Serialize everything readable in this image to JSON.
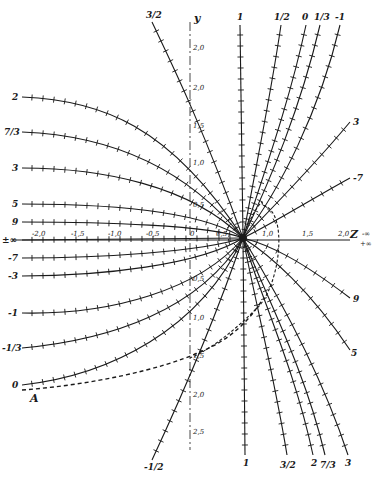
{
  "figure": {
    "axes": {
      "x_name": "Z",
      "x_name_suffix_top": "-∞",
      "x_name_suffix_bottom": "+∞",
      "y_name": "y",
      "x_ticks": [
        {
          "label": "-2,0",
          "x": 38
        },
        {
          "label": "-1,5",
          "x": 77
        },
        {
          "label": "-1,0",
          "x": 114
        },
        {
          "label": "-0,5",
          "x": 152
        },
        {
          "label": "0",
          "x": 192
        },
        {
          "label": "0,5",
          "x": 222
        },
        {
          "label": "1,0",
          "x": 266
        },
        {
          "label": "1,5",
          "x": 306
        },
        {
          "label": "2,0",
          "x": 343
        }
      ],
      "y_ticks_upper": [
        {
          "label": "2,0",
          "y": 48
        },
        {
          "label": "2,0",
          "y": 88
        },
        {
          "label": "1,5",
          "y": 126
        },
        {
          "label": "1,0",
          "y": 163
        },
        {
          "label": "0,5",
          "y": 205
        }
      ],
      "y_ticks_lower": [
        {
          "label": "0,5",
          "y": 279
        },
        {
          "label": "1,0",
          "y": 318
        },
        {
          "label": "1,5",
          "y": 356
        },
        {
          "label": "2,0",
          "y": 395
        },
        {
          "label": "2,5",
          "y": 432
        }
      ]
    },
    "curve_labels": {
      "left": [
        {
          "label": "2",
          "y": 97
        },
        {
          "label": "7/3",
          "y": 132
        },
        {
          "label": "3",
          "y": 168
        },
        {
          "label": "5",
          "y": 204
        },
        {
          "label": "9",
          "y": 222
        },
        {
          "label": "±∞",
          "y": 240
        },
        {
          "label": "-7",
          "y": 258
        },
        {
          "label": "-3",
          "y": 276
        },
        {
          "label": "-1",
          "y": 313
        },
        {
          "label": "-1/3",
          "y": 348
        },
        {
          "label": "0",
          "y": 385
        }
      ],
      "top": [
        {
          "label": "3/2",
          "x": 152
        },
        {
          "label": "1",
          "x": 240
        },
        {
          "label": "1/2",
          "x": 281
        },
        {
          "label": "0",
          "x": 306
        },
        {
          "label": "1/3",
          "x": 320
        },
        {
          "label": "-1",
          "x": 340
        }
      ],
      "right": [
        {
          "label": "3",
          "x": 355,
          "y": 122
        },
        {
          "label": "-7",
          "x": 355,
          "y": 178
        },
        {
          "label": "9",
          "x": 355,
          "y": 299
        },
        {
          "label": "5",
          "x": 352,
          "y": 352
        }
      ],
      "bottom": [
        {
          "label": "-1/2",
          "x": 150
        },
        {
          "label": "1",
          "x": 245
        },
        {
          "label": "3/2",
          "x": 287
        },
        {
          "label": "2",
          "x": 313
        },
        {
          "label": "7/3",
          "x": 325
        },
        {
          "label": "3",
          "x": 348
        }
      ]
    },
    "point_label": "A",
    "focus_label": "0,5"
  }
}
